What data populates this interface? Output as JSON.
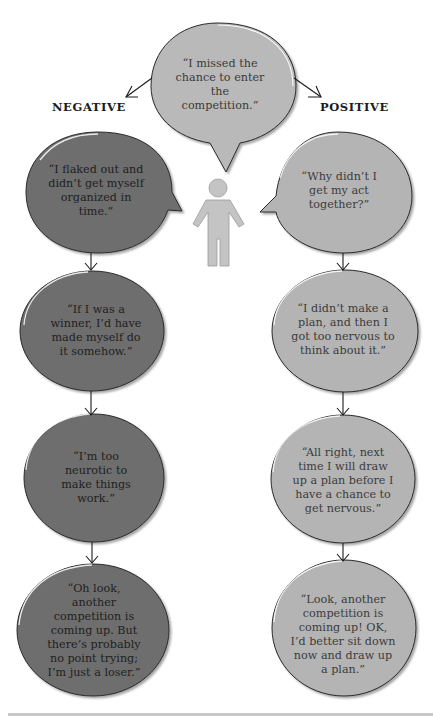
{
  "diagram": {
    "labels": {
      "negative": "NEGATIVE",
      "positive": "POSITIVE"
    },
    "root": {
      "text": "“I missed the chance to enter the competition.”"
    },
    "negative": [
      {
        "text": "“I flaked out and didn’t get myself organized in time.”"
      },
      {
        "text": "“If I was a winner, I’d have made myself do it somehow.”"
      },
      {
        "text": "“I’m too neurotic to make things work.”"
      },
      {
        "text": "“Oh look, another competition is coming up. But there’s probably no point trying; I’m just a loser.”"
      }
    ],
    "positive": [
      {
        "text": "“Why didn’t I get my act together?”"
      },
      {
        "text": "“I didn’t make a plan, and then I got too nervous to think about it.”"
      },
      {
        "text": "“All right, next time I will draw up a plan before I have a chance to get nervous.”"
      },
      {
        "text": "“Look, another competition is coming up! OK, I’d better sit down now and draw up a plan.”"
      }
    ],
    "colors": {
      "negative_fill": "#6e6e6e",
      "positive_fill": "#b4b4b4",
      "root_fill": "#b9b9b9",
      "figure_fill": "#c4c4c4",
      "outline": "#2a2a2a",
      "arrow": "#1a1a1a"
    }
  }
}
